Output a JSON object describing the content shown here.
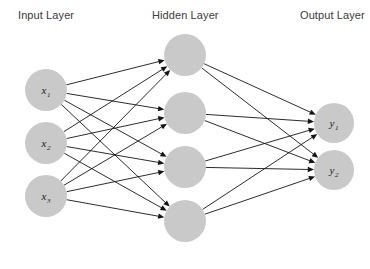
{
  "diagram": {
    "title_labels": {
      "input": "Input Layer",
      "hidden": "Hidden Layer",
      "output": "Output Layer"
    },
    "colors": {
      "background": "#ffffff",
      "node_fill": "#c9c9c9",
      "edge": "#141414",
      "label_text": "#3a3a3a",
      "node_text": "#1a1a1a"
    },
    "layers": [
      {
        "id": "input",
        "label": "Input Layer",
        "label_x": 18,
        "label_y": 19,
        "node_radius": 21,
        "nodes": [
          {
            "id": "x1",
            "base": "x",
            "sub": "1",
            "cx": 46,
            "cy": 90
          },
          {
            "id": "x2",
            "base": "x",
            "sub": "2",
            "cx": 46,
            "cy": 143
          },
          {
            "id": "x3",
            "base": "x",
            "sub": "3",
            "cx": 46,
            "cy": 196
          }
        ]
      },
      {
        "id": "hidden",
        "label": "Hidden Layer",
        "label_x": 152,
        "label_y": 19,
        "node_radius": 21,
        "nodes": [
          {
            "id": "h1",
            "base": "",
            "sub": "",
            "cx": 185,
            "cy": 55
          },
          {
            "id": "h2",
            "base": "",
            "sub": "",
            "cx": 185,
            "cy": 113
          },
          {
            "id": "h3",
            "base": "",
            "sub": "",
            "cx": 185,
            "cy": 167
          },
          {
            "id": "h4",
            "base": "",
            "sub": "",
            "cx": 185,
            "cy": 221
          }
        ]
      },
      {
        "id": "output",
        "label": "Output Layer",
        "label_x": 300,
        "label_y": 19,
        "node_radius": 20,
        "nodes": [
          {
            "id": "y1",
            "base": "y",
            "sub": "1",
            "cx": 334,
            "cy": 123
          },
          {
            "id": "y2",
            "base": "y",
            "sub": "2",
            "cx": 334,
            "cy": 170
          }
        ]
      }
    ],
    "connections": {
      "input_to_hidden": "fully-connected",
      "hidden_to_output": "fully-connected",
      "directed": true,
      "edge_count": 20
    }
  }
}
